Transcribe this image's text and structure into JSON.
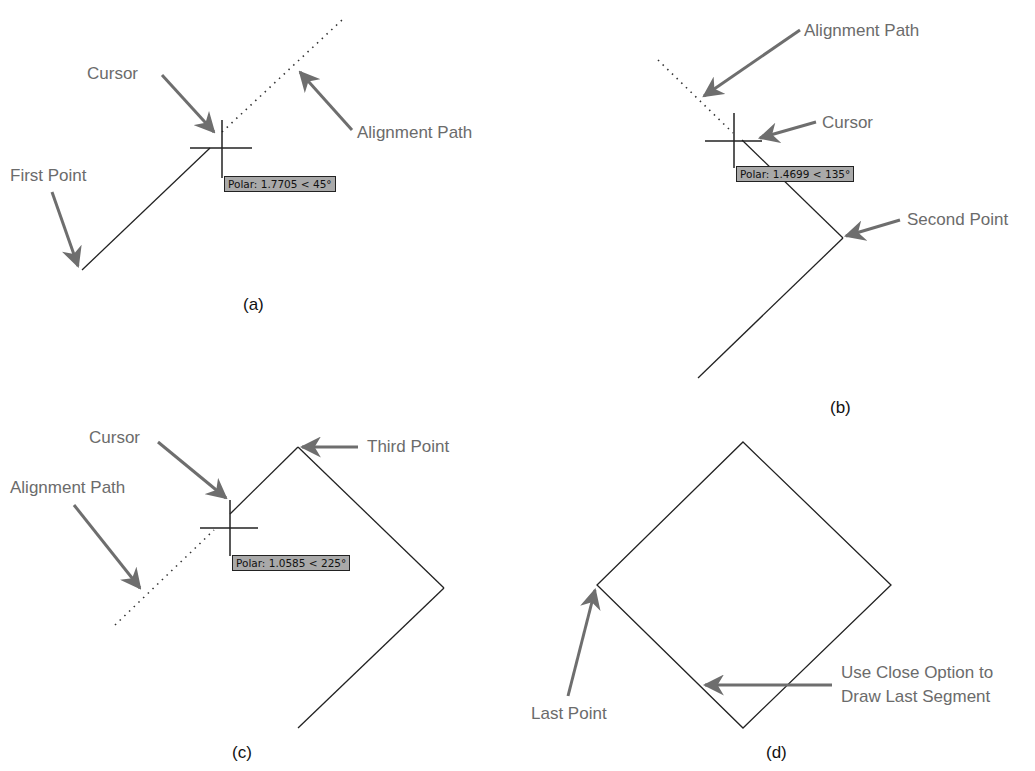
{
  "panels": {
    "a": {
      "caption": "(a)",
      "labels": {
        "cursor": "Cursor",
        "alignment_path": "Alignment Path",
        "first_point": "First Point"
      },
      "tooltip": "Polar: 1.7705 < 45°"
    },
    "b": {
      "caption": "(b)",
      "labels": {
        "alignment_path": "Alignment Path",
        "cursor": "Cursor",
        "second_point": "Second Point"
      },
      "tooltip": "Polar: 1.4699 < 135°"
    },
    "c": {
      "caption": "(c)",
      "labels": {
        "cursor": "Cursor",
        "third_point": "Third Point",
        "alignment_path": "Alignment Path"
      },
      "tooltip": "Polar: 1.0585 < 225°"
    },
    "d": {
      "caption": "(d)",
      "labels": {
        "last_point": "Last Point",
        "close_line1": "Use Close Option to",
        "close_line2": "Draw Last Segment"
      }
    }
  },
  "colors": {
    "line": "#222222",
    "arrow": "#6e6e6e",
    "tooltip_bg": "#a9a9a9"
  }
}
